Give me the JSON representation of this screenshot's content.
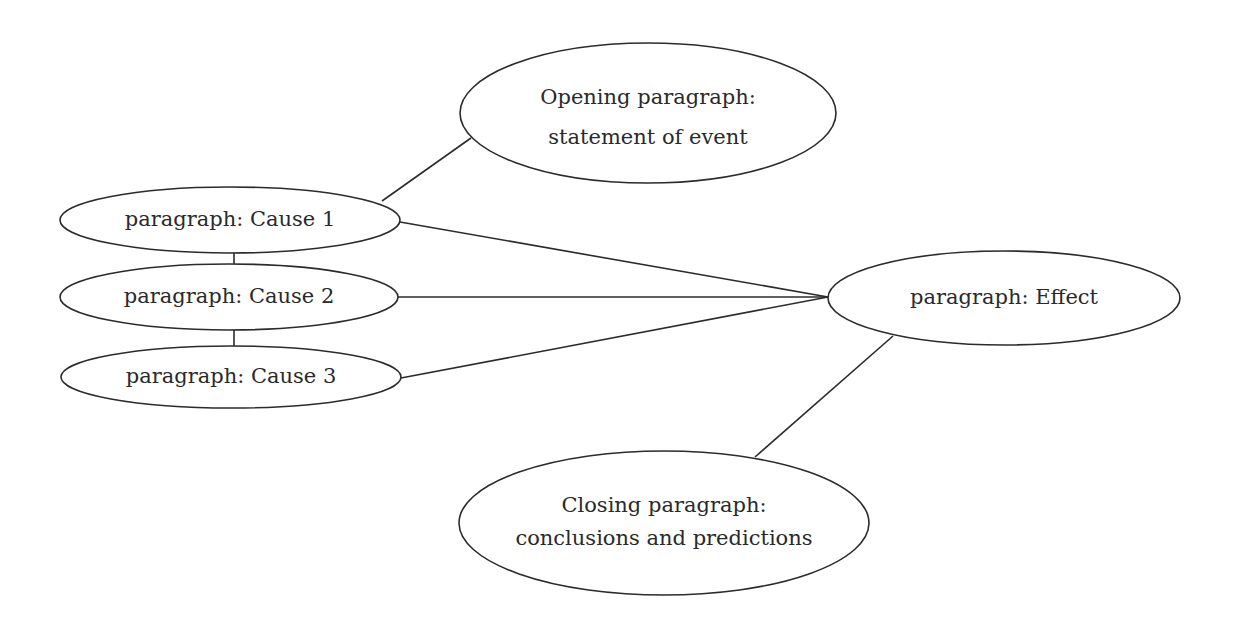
{
  "diagram": {
    "title": "",
    "nodes": {
      "opening": {
        "line1": "Opening paragraph:",
        "line2": "statement of event"
      },
      "cause1": {
        "label": "paragraph:  Cause 1"
      },
      "cause2": {
        "label": "paragraph:  Cause 2"
      },
      "cause3": {
        "label": "paragraph:  Cause 3"
      },
      "effect": {
        "label": "paragraph:  Effect"
      },
      "closing": {
        "line1": "Closing paragraph:",
        "line2": "conclusions and predictions"
      }
    },
    "edges": [
      {
        "from": "cause1",
        "to": "opening"
      },
      {
        "from": "cause1",
        "to": "cause2"
      },
      {
        "from": "cause2",
        "to": "cause3"
      },
      {
        "from": "cause1",
        "to": "effect"
      },
      {
        "from": "cause2",
        "to": "effect"
      },
      {
        "from": "cause3",
        "to": "effect"
      },
      {
        "from": "effect",
        "to": "closing"
      }
    ],
    "colors": {
      "stroke": "#2b2b2b",
      "text": "#2a2a2a",
      "background": "#ffffff"
    }
  }
}
